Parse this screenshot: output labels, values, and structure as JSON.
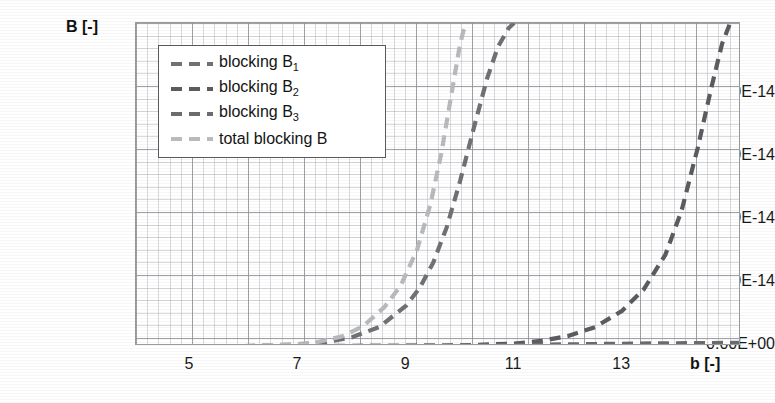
{
  "chart_data": {
    "type": "line",
    "title": "",
    "xlabel": "b [-]",
    "ylabel": "B [-]",
    "xlim": [
      4.0,
      15.2
    ],
    "ylim": [
      0.0,
      5.13e-14
    ],
    "grid": true,
    "legend_position": "upper-left-inside",
    "x_ticks": [
      "5",
      "7",
      "9",
      "11",
      "13"
    ],
    "x_tick_values": [
      5,
      7,
      9,
      11,
      13
    ],
    "y_ticks": [
      "0.00E+00",
      "1.00E-14",
      "2.00E-14",
      "3.00E-14",
      "4.00E-14"
    ],
    "y_tick_values": [
      0,
      1e-14,
      2e-14,
      3e-14,
      4e-14
    ],
    "series": [
      {
        "name": "blocking B₁",
        "legend_label": "blocking B",
        "legend_sub": "1",
        "color": "#6f7175",
        "style": "dashed",
        "x": [
          4.0,
          6.0,
          7.0,
          7.5,
          8.0,
          8.5,
          9.0,
          9.25,
          9.5,
          9.75,
          10.0,
          10.25,
          10.5,
          10.7,
          10.9,
          11.0
        ],
        "y": [
          0,
          0,
          2e-16,
          6e-16,
          1.4e-15,
          3e-15,
          6.4e-15,
          9.2e-15,
          1.32e-14,
          1.88e-14,
          2.62e-14,
          3.45e-14,
          4.25e-14,
          4.75e-14,
          5.05e-14,
          5.13e-14
        ]
      },
      {
        "name": "blocking B₂",
        "legend_label": "blocking B",
        "legend_sub": "2",
        "color": "#5a5c60",
        "style": "dashed",
        "x": [
          4.0,
          8.0,
          10.0,
          11.0,
          11.5,
          12.0,
          12.5,
          13.0,
          13.4,
          13.8,
          14.1,
          14.4,
          14.65,
          14.85,
          15.0
        ],
        "y": [
          0,
          0,
          1e-16,
          4e-16,
          8e-16,
          1.6e-15,
          3e-15,
          5.6e-15,
          9e-15,
          1.45e-14,
          2.15e-14,
          3.15e-14,
          4.1e-14,
          4.8e-14,
          5.13e-14
        ]
      },
      {
        "name": "blocking B₃",
        "legend_label": "blocking B",
        "legend_sub": "3",
        "color": "#6a6c70",
        "style": "dashed",
        "x": [
          4.0,
          6.0,
          8.0,
          9.0,
          10.0,
          11.0,
          12.0,
          13.0,
          14.0,
          15.2
        ],
        "y": [
          0,
          0,
          1e-17,
          3e-17,
          8e-17,
          1.6e-16,
          2.6e-16,
          3.6e-16,
          4.4e-16,
          5e-16
        ]
      },
      {
        "name": "total blocking B",
        "legend_label": "total blocking B",
        "legend_sub": "",
        "color": "#b9babd",
        "style": "dashed",
        "x": [
          4.0,
          6.0,
          7.0,
          7.4,
          7.8,
          8.2,
          8.6,
          8.9,
          9.2,
          9.45,
          9.65,
          9.85,
          10.0,
          10.1
        ],
        "y": [
          0,
          0,
          3e-16,
          7e-16,
          1.5e-15,
          3.1e-15,
          6.2e-15,
          9.6e-15,
          1.52e-14,
          2.25e-14,
          3.05e-14,
          4.05e-14,
          4.8e-14,
          5.13e-14
        ]
      }
    ]
  },
  "axes": {
    "y_title": "B [-]",
    "x_title": "b [-]"
  }
}
